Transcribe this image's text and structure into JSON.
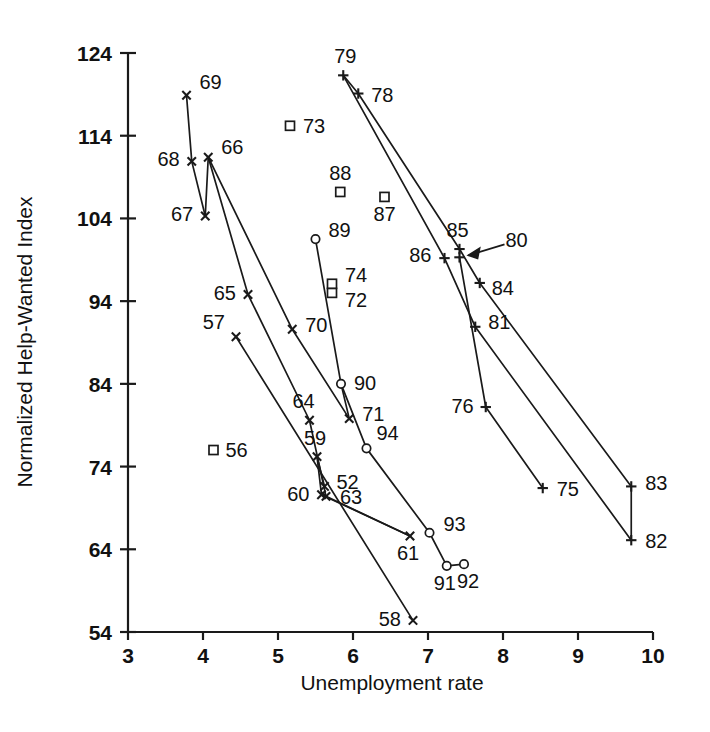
{
  "chart_data": {
    "type": "scatter",
    "title": "",
    "xlabel": "Unemployment rate",
    "ylabel": "Normalized Help-Wanted Index",
    "xlim": [
      3,
      10
    ],
    "ylim": [
      54,
      124
    ],
    "xticks": [
      3,
      4,
      5,
      6,
      7,
      8,
      9,
      10
    ],
    "yticks": [
      54,
      64,
      74,
      84,
      94,
      104,
      114,
      124
    ],
    "grid": false,
    "legend": null,
    "annotations": [
      {
        "text": "80",
        "points_to": "year-80",
        "style": "arrow"
      }
    ],
    "marker_kinds": [
      "x-cross",
      "plus",
      "open-square",
      "open-circle"
    ],
    "points": [
      {
        "label": "52",
        "x": 5.62,
        "y": 71.6,
        "marker": "x-cross"
      },
      {
        "label": "56",
        "x": 4.14,
        "y": 76.0,
        "marker": "open-square"
      },
      {
        "label": "57",
        "x": 4.44,
        "y": 89.7,
        "marker": "x-cross"
      },
      {
        "label": "58",
        "x": 6.8,
        "y": 55.4,
        "marker": "x-cross"
      },
      {
        "label": "59",
        "x": 5.52,
        "y": 75.2,
        "marker": "x-cross"
      },
      {
        "label": "60",
        "x": 5.58,
        "y": 70.6,
        "marker": "x-cross"
      },
      {
        "label": "61",
        "x": 6.76,
        "y": 65.6,
        "marker": "x-cross"
      },
      {
        "label": "63",
        "x": 5.64,
        "y": 70.4,
        "marker": "x-cross"
      },
      {
        "label": "64",
        "x": 5.42,
        "y": 79.6,
        "marker": "x-cross"
      },
      {
        "label": "65",
        "x": 4.6,
        "y": 94.8,
        "marker": "x-cross"
      },
      {
        "label": "66",
        "x": 4.07,
        "y": 111.4,
        "marker": "x-cross"
      },
      {
        "label": "67",
        "x": 4.03,
        "y": 104.3,
        "marker": "x-cross"
      },
      {
        "label": "68",
        "x": 3.85,
        "y": 110.9,
        "marker": "x-cross"
      },
      {
        "label": "69",
        "x": 3.78,
        "y": 118.9,
        "marker": "x-cross"
      },
      {
        "label": "70",
        "x": 5.19,
        "y": 90.6,
        "marker": "x-cross"
      },
      {
        "label": "71",
        "x": 5.95,
        "y": 79.8,
        "marker": "x-cross"
      },
      {
        "label": "72",
        "x": 5.72,
        "y": 95.0,
        "marker": "open-square"
      },
      {
        "label": "73",
        "x": 5.16,
        "y": 115.2,
        "marker": "open-square"
      },
      {
        "label": "74",
        "x": 5.72,
        "y": 96.1,
        "marker": "open-square"
      },
      {
        "label": "75",
        "x": 8.53,
        "y": 71.4,
        "marker": "plus"
      },
      {
        "label": "76",
        "x": 7.77,
        "y": 81.2,
        "marker": "plus"
      },
      {
        "label": "78",
        "x": 6.07,
        "y": 119.1,
        "marker": "plus"
      },
      {
        "label": "79",
        "x": 5.87,
        "y": 121.3,
        "marker": "plus"
      },
      {
        "label": "80",
        "x": 7.42,
        "y": 99.3,
        "marker": "plus"
      },
      {
        "label": "81",
        "x": 7.63,
        "y": 90.9,
        "marker": "plus"
      },
      {
        "label": "82",
        "x": 9.71,
        "y": 65.1,
        "marker": "plus"
      },
      {
        "label": "83",
        "x": 9.71,
        "y": 71.6,
        "marker": "plus"
      },
      {
        "label": "84",
        "x": 7.69,
        "y": 96.2,
        "marker": "plus"
      },
      {
        "label": "85",
        "x": 7.42,
        "y": 100.3,
        "marker": "plus"
      },
      {
        "label": "86",
        "x": 7.22,
        "y": 99.2,
        "marker": "plus"
      },
      {
        "label": "87",
        "x": 6.42,
        "y": 106.6,
        "marker": "open-square"
      },
      {
        "label": "88",
        "x": 5.83,
        "y": 107.2,
        "marker": "open-square"
      },
      {
        "label": "89",
        "x": 5.5,
        "y": 101.5,
        "marker": "open-circle"
      },
      {
        "label": "90",
        "x": 5.84,
        "y": 84.0,
        "marker": "open-circle"
      },
      {
        "label": "91",
        "x": 7.25,
        "y": 62.0,
        "marker": "open-circle"
      },
      {
        "label": "92",
        "x": 7.48,
        "y": 62.2,
        "marker": "open-circle"
      },
      {
        "label": "93",
        "x": 7.02,
        "y": 66.0,
        "marker": "open-circle"
      },
      {
        "label": "94",
        "x": 6.18,
        "y": 76.2,
        "marker": "open-circle"
      }
    ],
    "connections": [
      [
        "52",
        "59"
      ],
      [
        "59",
        "60"
      ],
      [
        "60",
        "61"
      ],
      [
        "61",
        "63"
      ],
      [
        "63",
        "64"
      ],
      [
        "64",
        "65"
      ],
      [
        "65",
        "66"
      ],
      [
        "66",
        "67"
      ],
      [
        "67",
        "68"
      ],
      [
        "68",
        "69"
      ],
      [
        "66",
        "70"
      ],
      [
        "70",
        "71"
      ],
      [
        "57",
        "58"
      ],
      [
        "71",
        "90"
      ],
      [
        "89",
        "90"
      ],
      [
        "90",
        "94"
      ],
      [
        "94",
        "93"
      ],
      [
        "93",
        "91"
      ],
      [
        "91",
        "92"
      ],
      [
        "78",
        "79"
      ],
      [
        "78",
        "85"
      ],
      [
        "79",
        "86"
      ],
      [
        "85",
        "84"
      ],
      [
        "84",
        "83"
      ],
      [
        "86",
        "81"
      ],
      [
        "81",
        "82"
      ],
      [
        "80",
        "76"
      ],
      [
        "76",
        "75"
      ],
      [
        "83",
        "82"
      ]
    ]
  },
  "axis": {
    "x_title": "Unemployment rate",
    "y_title": "Normalized Help-Wanted Index"
  }
}
